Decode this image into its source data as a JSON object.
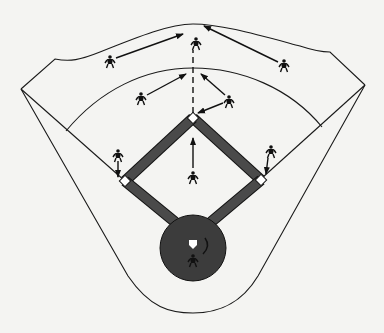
{
  "diagram": {
    "colors": {
      "background": "#f4f4f2",
      "line": "#1a1a1a",
      "basepath": "#4a4a4a",
      "home_circle": "#3c3c3c",
      "base": "#ffffff",
      "player": "#111111"
    },
    "field": {
      "outfield_fence": "M21,89 L55,59 C70,62 80,60 100,52 C140,36 170,24 193,24 C220,24 255,34 300,46 C315,51 322,52 330,52 L365,85",
      "infield_arc": "M66,131 C100,90 145,68 193,68 C241,68 290,88 322,127",
      "foul_line_left": "M21,89 L125,181",
      "foul_line_right": "M365,85 L262,178",
      "outer_foul_curve": "M21,89 L128,276 C150,308 170,313 193,313 C216,313 240,306 258,276 L365,85",
      "foul_left_inner": "M21,89 L125,181",
      "foul_right_inner": "M365,85 L262,178"
    },
    "bases": [
      {
        "name": "second-base",
        "x": 193,
        "y": 118
      },
      {
        "name": "first-base",
        "x": 261,
        "y": 180
      },
      {
        "name": "third-base",
        "x": 125,
        "y": 181
      }
    ],
    "home": {
      "cx": 193,
      "cy": 248,
      "r": 33,
      "plate_x": 193,
      "plate_y": 246
    },
    "players": [
      {
        "name": "center-fielder",
        "x": 196,
        "y": 43
      },
      {
        "name": "left-fielder",
        "x": 110,
        "y": 61
      },
      {
        "name": "right-fielder",
        "x": 284,
        "y": 65
      },
      {
        "name": "shortstop",
        "x": 141,
        "y": 98
      },
      {
        "name": "second-baseman",
        "x": 229,
        "y": 101
      },
      {
        "name": "pitcher",
        "x": 193,
        "y": 177
      },
      {
        "name": "third-baseman",
        "x": 118,
        "y": 155
      },
      {
        "name": "first-baseman",
        "x": 271,
        "y": 151
      },
      {
        "name": "catcher",
        "x": 193,
        "y": 260
      }
    ],
    "arrows": [
      {
        "name": "left-fielder-arrow",
        "x1": 116,
        "y1": 58,
        "x2": 183,
        "y2": 34
      },
      {
        "name": "right-fielder-arrow",
        "x1": 278,
        "y1": 62,
        "x2": 204,
        "y2": 26
      },
      {
        "name": "shortstop-arrow",
        "x1": 147,
        "y1": 95,
        "x2": 186,
        "y2": 74
      },
      {
        "name": "second-baseman-arrow-outfield",
        "x1": 225,
        "y1": 95,
        "x2": 201,
        "y2": 74
      },
      {
        "name": "second-baseman-arrow-base",
        "x1": 223,
        "y1": 103,
        "x2": 198,
        "y2": 113
      },
      {
        "name": "pitcher-arrow",
        "x1": 193,
        "y1": 168,
        "x2": 193,
        "y2": 138
      },
      {
        "name": "third-baseman-arrow",
        "x1": 118,
        "y1": 161,
        "x2": 118,
        "y2": 177
      },
      {
        "name": "first-baseman-arrow",
        "x1": 268,
        "y1": 158,
        "x2": 266,
        "y2": 174
      }
    ],
    "throw_line": {
      "name": "relay-dashed-line",
      "x1": 193,
      "y1": 113,
      "x2": 193,
      "y2": 50
    }
  }
}
